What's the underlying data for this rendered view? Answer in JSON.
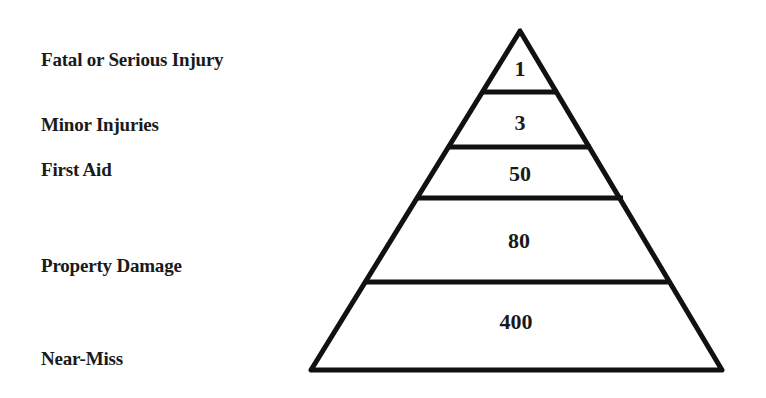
{
  "diagram": {
    "type": "pyramid",
    "title": "",
    "levels": [
      {
        "label": "Fatal or Serious Injury",
        "value": "1"
      },
      {
        "label": "Minor Injuries",
        "value": "3"
      },
      {
        "label": "First Aid",
        "value": "50"
      },
      {
        "label": "Property Damage",
        "value": "80"
      },
      {
        "label": "Near-Miss",
        "value": "400"
      }
    ],
    "colors": {
      "stroke": "#111111",
      "background": "#ffffff",
      "text": "#1a1a1a"
    }
  }
}
